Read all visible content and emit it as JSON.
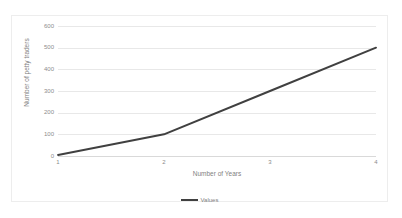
{
  "chart_data": {
    "type": "line",
    "title": "",
    "xlabel": "Number of Years",
    "ylabel": "Number of petty traders",
    "x": [
      1,
      2,
      3,
      4
    ],
    "xtick_labels": [
      "1",
      "2",
      "3",
      "4"
    ],
    "ytick_labels": [
      "0",
      "100",
      "200",
      "300",
      "400",
      "500",
      "600"
    ],
    "yticks": [
      0,
      100,
      200,
      300,
      400,
      500,
      600
    ],
    "ylim": [
      0,
      600
    ],
    "xlim": [
      1,
      4
    ],
    "grid": "horizontal",
    "legend_position": "bottom",
    "series": [
      {
        "name": "Values",
        "values": [
          5,
          100,
          300,
          500
        ],
        "color": "#404040"
      }
    ]
  },
  "legend": {
    "entries": [
      {
        "label": "Values",
        "swatch": "line-swatch"
      }
    ]
  },
  "colors": {
    "series_line": "#404040",
    "gridline": "#e8e8e8",
    "axis_text": "#8c8c8c",
    "title_text": "#7f7f7f",
    "frame_border": "#ededed",
    "background": "#ffffff"
  }
}
